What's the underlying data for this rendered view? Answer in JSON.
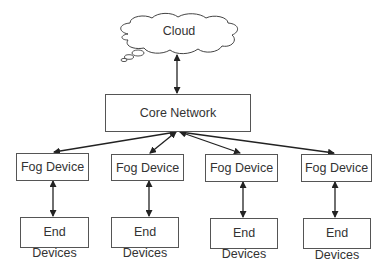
{
  "diagram": {
    "type": "fog-computing-architecture",
    "cloud": {
      "label": "Cloud"
    },
    "core": {
      "label": "Core Network"
    },
    "fog_devices": [
      {
        "label": "Fog Device"
      },
      {
        "label": "Fog Device"
      },
      {
        "label": "Fog Device"
      },
      {
        "label": "Fog Device"
      }
    ],
    "end_devices": [
      {
        "label_top": "End",
        "label_bottom": "Devices"
      },
      {
        "label_top": "End",
        "label_bottom": "Devices"
      },
      {
        "label_top": "End",
        "label_bottom": "Devices"
      },
      {
        "label_top": "End",
        "label_bottom": "Devices"
      }
    ],
    "edges": [
      {
        "from": "Cloud",
        "to": "Core Network",
        "direction": "bidirectional"
      },
      {
        "from": "Core Network",
        "to": "Fog Device 1",
        "direction": "bidirectional"
      },
      {
        "from": "Core Network",
        "to": "Fog Device 2",
        "direction": "bidirectional"
      },
      {
        "from": "Core Network",
        "to": "Fog Device 3",
        "direction": "bidirectional"
      },
      {
        "from": "Core Network",
        "to": "Fog Device 4",
        "direction": "bidirectional"
      },
      {
        "from": "Fog Device 1",
        "to": "End Devices 1",
        "direction": "bidirectional"
      },
      {
        "from": "Fog Device 2",
        "to": "End Devices 2",
        "direction": "bidirectional"
      },
      {
        "from": "Fog Device 3",
        "to": "End Devices 3",
        "direction": "bidirectional"
      },
      {
        "from": "Fog Device 4",
        "to": "End Devices 4",
        "direction": "bidirectional"
      }
    ],
    "colors": {
      "stroke": "#333333",
      "background": "#ffffff",
      "text": "#333333"
    }
  }
}
